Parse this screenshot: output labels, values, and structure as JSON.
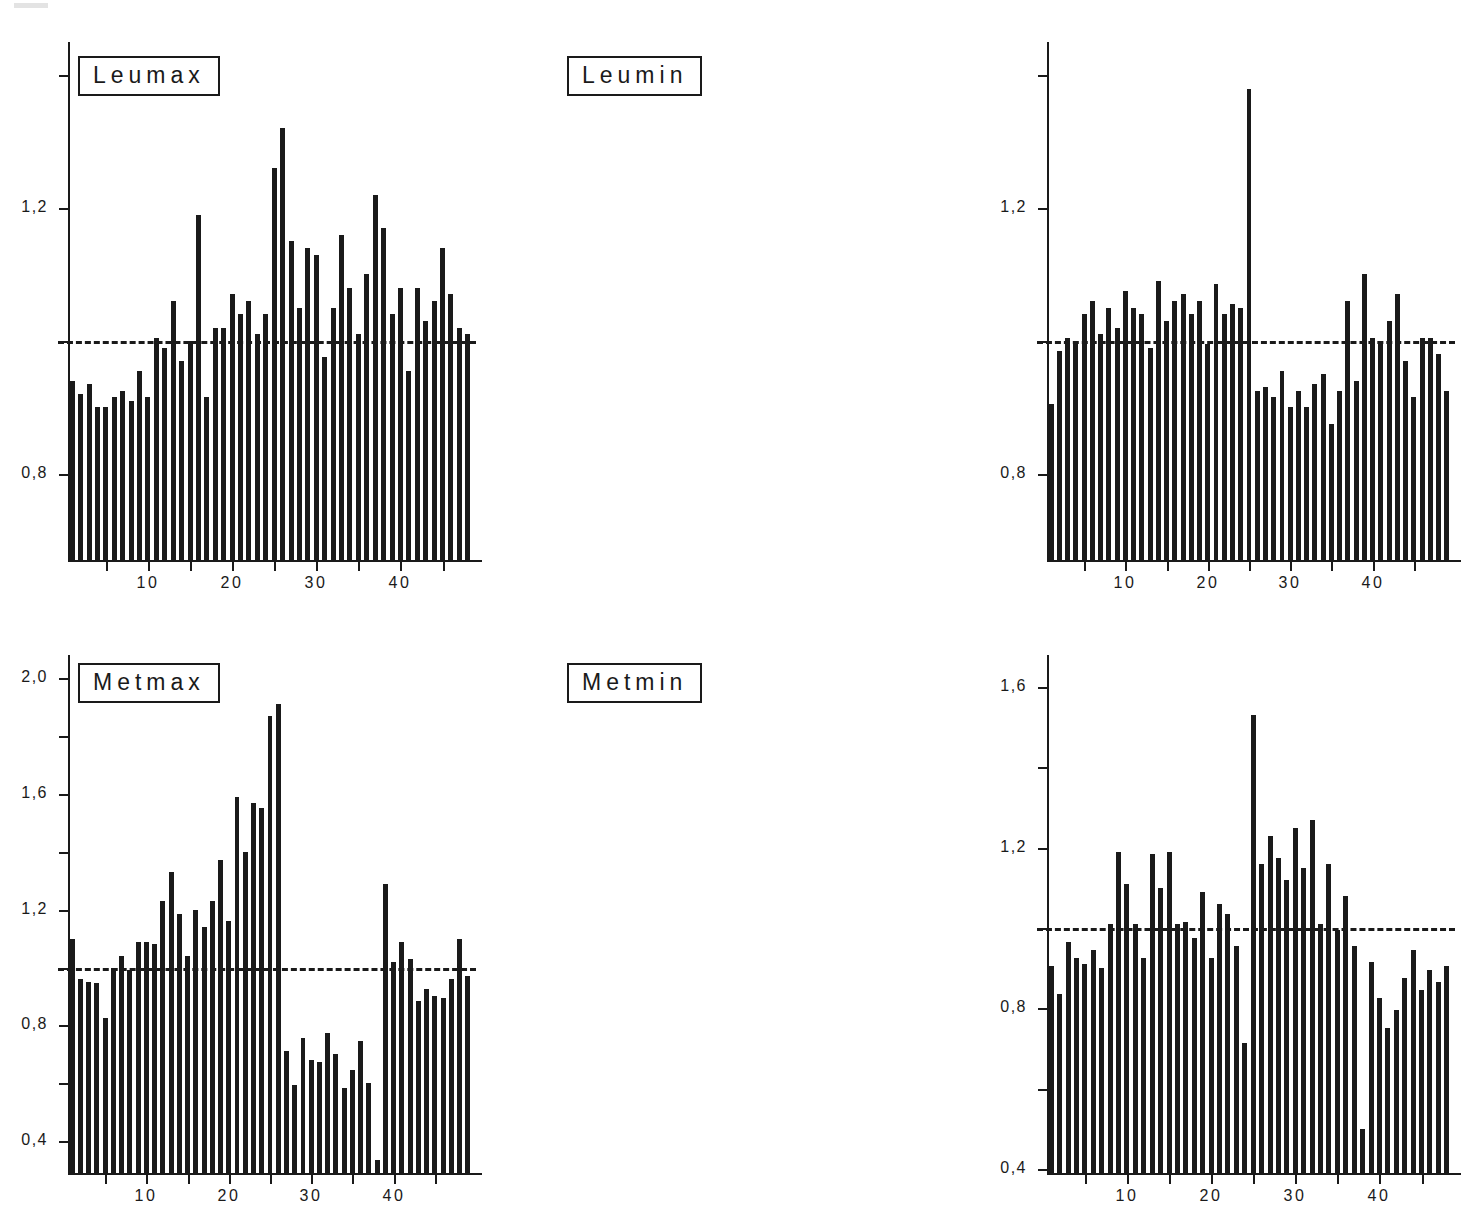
{
  "figure": {
    "type": "multi-panel-bar-chart",
    "panel_count": 4,
    "layout": "2x2",
    "bar_color": "#1a1a1a",
    "background": "#ffffff",
    "reference_line_value": 1.0,
    "reference_line_style": "dashed"
  },
  "chart_data": [
    {
      "type": "bar",
      "title": "Leumax",
      "xlabel": "",
      "ylabel": "",
      "ylim": [
        0.67,
        1.45
      ],
      "xlim": [
        0.5,
        48.5
      ],
      "grid": false,
      "legend_position": "top-left",
      "reference_line": 1.0,
      "ytick_values": [
        0.8,
        1.0,
        1.2,
        1.4
      ],
      "ytick_labels": [
        "0,8",
        "",
        "1,2",
        ""
      ],
      "xtick_values": [
        5,
        10,
        15,
        20,
        25,
        30,
        35,
        40,
        45
      ],
      "xtick_labels": [
        "",
        "10",
        "",
        "20",
        "",
        "30",
        "",
        "40",
        ""
      ],
      "categories": [
        1,
        2,
        3,
        4,
        5,
        6,
        7,
        8,
        9,
        10,
        11,
        12,
        13,
        14,
        15,
        16,
        17,
        18,
        19,
        20,
        21,
        22,
        23,
        24,
        25,
        26,
        27,
        28,
        29,
        30,
        31,
        32,
        33,
        34,
        35,
        36,
        37,
        38,
        39,
        40,
        41,
        42,
        43,
        44,
        45,
        46,
        47,
        48
      ],
      "values": [
        0.94,
        0.92,
        0.935,
        0.9,
        0.9,
        0.915,
        0.925,
        0.91,
        0.955,
        0.915,
        1.005,
        0.99,
        1.06,
        0.97,
        1.0,
        1.19,
        0.915,
        1.02,
        1.02,
        1.07,
        1.04,
        1.06,
        1.01,
        1.04,
        1.26,
        1.32,
        1.15,
        1.05,
        1.14,
        1.13,
        0.975,
        1.05,
        1.16,
        1.08,
        1.01,
        1.1,
        1.22,
        1.17,
        1.04,
        1.08,
        0.955,
        1.08,
        1.03,
        1.06,
        1.14,
        1.07,
        1.02,
        1.01
      ]
    },
    {
      "type": "bar",
      "title": "Leumin",
      "xlabel": "",
      "ylabel": "",
      "ylim": [
        0.67,
        1.45
      ],
      "xlim": [
        0.5,
        48.5
      ],
      "grid": false,
      "legend_position": "top-left",
      "reference_line": 1.0,
      "ytick_values": [
        0.8,
        1.0,
        1.2,
        1.4
      ],
      "ytick_labels": [
        "0,8",
        "",
        "1,2",
        ""
      ],
      "xtick_values": [
        5,
        10,
        15,
        20,
        25,
        30,
        35,
        40,
        45
      ],
      "xtick_labels": [
        "",
        "10",
        "",
        "20",
        "",
        "30",
        "",
        "40",
        ""
      ],
      "categories": [
        1,
        2,
        3,
        4,
        5,
        6,
        7,
        8,
        9,
        10,
        11,
        12,
        13,
        14,
        15,
        16,
        17,
        18,
        19,
        20,
        21,
        22,
        23,
        24,
        25,
        26,
        27,
        28,
        29,
        30,
        31,
        32,
        33,
        34,
        35,
        36,
        37,
        38,
        39,
        40,
        41,
        42,
        43,
        44,
        45,
        46,
        47,
        48
      ],
      "values": [
        0.905,
        0.985,
        1.005,
        1.0,
        1.04,
        1.06,
        1.01,
        1.05,
        1.02,
        1.075,
        1.05,
        1.04,
        0.99,
        1.09,
        1.03,
        1.06,
        1.07,
        1.04,
        1.06,
        0.995,
        1.085,
        1.04,
        1.055,
        1.05,
        1.38,
        0.925,
        0.93,
        0.915,
        0.955,
        0.9,
        0.925,
        0.9,
        0.935,
        0.95,
        0.875,
        0.925,
        1.06,
        0.94,
        1.1,
        1.005,
        1.0,
        1.03,
        1.07,
        0.97,
        0.915,
        1.005,
        1.005,
        0.98,
        0.925
      ]
    },
    {
      "type": "bar",
      "title": "Metmax",
      "xlabel": "",
      "ylabel": "",
      "ylim": [
        0.29,
        2.08
      ],
      "xlim": [
        0.5,
        48.5
      ],
      "grid": false,
      "legend_position": "top-left",
      "reference_line": 1.0,
      "ytick_values": [
        0.4,
        0.6,
        0.8,
        1.0,
        1.2,
        1.4,
        1.6,
        1.8,
        2.0
      ],
      "ytick_labels": [
        "0,4",
        "",
        "0,8",
        "",
        "1,2",
        "",
        "1,6",
        "",
        "2,0"
      ],
      "xtick_values": [
        5,
        10,
        15,
        20,
        25,
        30,
        35,
        40,
        45
      ],
      "xtick_labels": [
        "",
        "10",
        "",
        "20",
        "",
        "30",
        "",
        "40",
        ""
      ],
      "categories": [
        1,
        2,
        3,
        4,
        5,
        6,
        7,
        8,
        9,
        10,
        11,
        12,
        13,
        14,
        15,
        16,
        17,
        18,
        19,
        20,
        21,
        22,
        23,
        24,
        25,
        26,
        27,
        28,
        29,
        30,
        31,
        32,
        33,
        34,
        35,
        36,
        37,
        38,
        39,
        40,
        41,
        42,
        43,
        44,
        45,
        46,
        47,
        48
      ],
      "values": [
        1.1,
        0.96,
        0.95,
        0.945,
        0.825,
        1.0,
        1.04,
        0.99,
        1.09,
        1.09,
        1.08,
        1.23,
        1.33,
        1.185,
        1.04,
        1.2,
        1.14,
        1.23,
        1.37,
        1.16,
        1.59,
        1.4,
        1.57,
        1.55,
        1.87,
        1.91,
        0.71,
        0.595,
        0.755,
        0.68,
        0.675,
        0.775,
        0.7,
        0.585,
        0.645,
        0.745,
        0.6,
        0.335,
        1.29,
        1.02,
        1.09,
        1.03,
        0.885,
        0.925,
        0.9,
        0.895,
        0.96,
        1.1,
        0.97
      ]
    },
    {
      "type": "bar",
      "title": "Metmin",
      "xlabel": "",
      "ylabel": "",
      "ylim": [
        0.39,
        1.68
      ],
      "xlim": [
        0.5,
        48.5
      ],
      "grid": false,
      "legend_position": "top-left",
      "reference_line": 1.0,
      "ytick_values": [
        0.4,
        0.6,
        0.8,
        1.0,
        1.2,
        1.4,
        1.6
      ],
      "ytick_labels": [
        "0,4",
        "",
        "0,8",
        "",
        "1,2",
        "",
        "1,6"
      ],
      "xtick_values": [
        5,
        10,
        15,
        20,
        25,
        30,
        35,
        40,
        45
      ],
      "xtick_labels": [
        "",
        "10",
        "",
        "20",
        "",
        "30",
        "",
        "40",
        ""
      ],
      "categories": [
        1,
        2,
        3,
        4,
        5,
        6,
        7,
        8,
        9,
        10,
        11,
        12,
        13,
        14,
        15,
        16,
        17,
        18,
        19,
        20,
        21,
        22,
        23,
        24,
        25,
        26,
        27,
        28,
        29,
        30,
        31,
        32,
        33,
        34,
        35,
        36,
        37,
        38,
        39,
        40,
        41,
        42,
        43,
        44,
        45,
        46,
        47,
        48
      ],
      "values": [
        0.905,
        0.835,
        0.965,
        0.925,
        0.91,
        0.945,
        0.9,
        1.01,
        1.19,
        1.11,
        1.01,
        0.925,
        1.185,
        1.1,
        1.19,
        1.01,
        1.015,
        0.975,
        1.09,
        0.925,
        1.06,
        1.035,
        0.955,
        0.715,
        1.53,
        1.16,
        1.23,
        1.175,
        1.12,
        1.25,
        1.15,
        1.27,
        1.01,
        1.16,
        0.995,
        1.08,
        0.955,
        0.5,
        0.915,
        0.825,
        0.75,
        0.795,
        0.875,
        0.945,
        0.845,
        0.895,
        0.865,
        0.905
      ]
    }
  ],
  "panels": [
    {
      "name": "leumax",
      "legend_label": "Leumax",
      "y_labels": [
        "1,2",
        "0,8"
      ],
      "x_labels": [
        "10",
        "20",
        "30",
        "40"
      ]
    },
    {
      "name": "leumin",
      "legend_label": "Leumin",
      "y_labels": [
        "1,2",
        "0,8"
      ],
      "x_labels": [
        "10",
        "20",
        "30",
        "40"
      ]
    },
    {
      "name": "metmax",
      "legend_label": "Metmax",
      "y_labels": [
        "2,0",
        "1,6",
        "1,2",
        "0,8",
        "0,4"
      ],
      "x_labels": [
        "10",
        "20",
        "30",
        "40"
      ]
    },
    {
      "name": "metmin",
      "legend_label": "Metmin",
      "y_labels": [
        "1,6",
        "1,2",
        "0,8",
        "0,4"
      ],
      "x_labels": [
        "10",
        "20",
        "30",
        "40"
      ]
    }
  ]
}
